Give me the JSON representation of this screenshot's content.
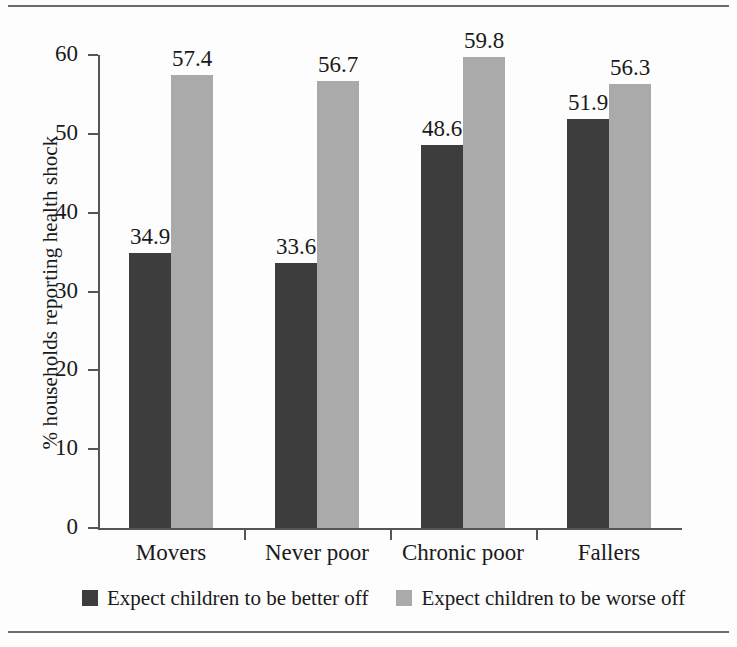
{
  "chart_data": {
    "type": "bar",
    "title": "",
    "subtitle": "",
    "xlabel": "",
    "ylabel": "% households reporting health shock",
    "ylim": [
      0,
      60
    ],
    "yticks": [
      0,
      10,
      20,
      30,
      40,
      50,
      60
    ],
    "ytick_labels": [
      "0",
      "10",
      "20",
      "30",
      "40",
      "50",
      "60"
    ],
    "grid": false,
    "legend_position": "bottom",
    "categories": [
      "Movers",
      "Never poor",
      "Chronic poor",
      "Fallers"
    ],
    "series": [
      {
        "name": "Expect children to be better off",
        "color": "#3d3d3d",
        "values": [
          34.9,
          33.6,
          48.6,
          51.9
        ],
        "value_labels": [
          "34.9",
          "33.6",
          "48.6",
          "51.9"
        ]
      },
      {
        "name": "Expect children to be worse off",
        "color": "#aaaaaa",
        "values": [
          57.4,
          56.7,
          59.8,
          56.3
        ],
        "value_labels": [
          "57.4",
          "56.7",
          "59.8",
          "56.3"
        ]
      }
    ],
    "annotations": []
  },
  "figure": {
    "background": "#fdfdfd",
    "rule_color": "#6b6b6b",
    "axis_color": "#555555",
    "text_color": "#1a1a1a"
  },
  "legend": {
    "items": [
      {
        "label": "Expect children to be better off",
        "color": "#3d3d3d"
      },
      {
        "label": "Expect children to be worse off",
        "color": "#aaaaaa"
      }
    ]
  }
}
